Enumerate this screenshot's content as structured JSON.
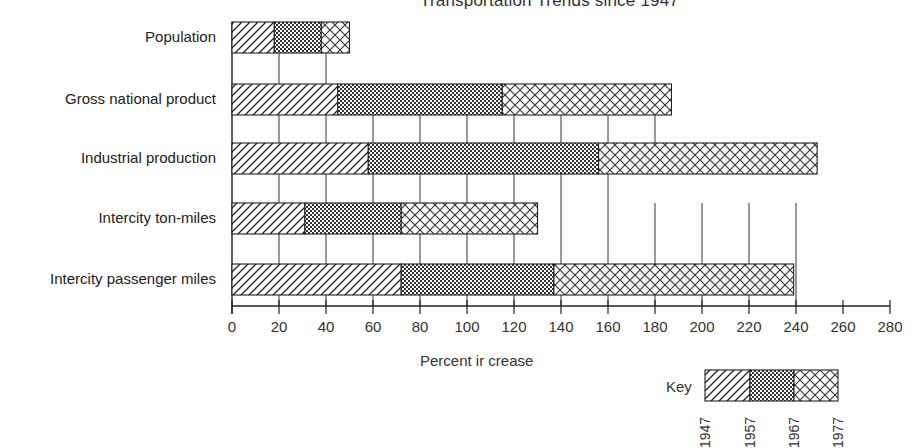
{
  "chart_data": {
    "type": "bar",
    "orientation": "horizontal",
    "stacked": true,
    "title": "Transportation Trends since 1947",
    "title_visible_fragment": "ansportation Trends since 1947",
    "xlabel": "Percent increase",
    "ylabel": "",
    "xlim": [
      0,
      280
    ],
    "xticks": [
      0,
      20,
      40,
      60,
      80,
      100,
      120,
      140,
      160,
      180,
      200,
      220,
      240,
      260,
      280
    ],
    "grid": "vertical gridlines between bars",
    "categories": [
      "Population",
      "Gross national product",
      "Industrial production",
      "Intercity ton-miles",
      "Intercity passenger miles"
    ],
    "cumulative_ends": [
      {
        "category": "Population",
        "1957": 18,
        "1967": 38,
        "1977": 50
      },
      {
        "category": "Gross national product",
        "1957": 45,
        "1967": 115,
        "1977": 187
      },
      {
        "category": "Industrial production",
        "1957": 58,
        "1967": 156,
        "1977": 249
      },
      {
        "category": "Intercity ton-miles",
        "1957": 31,
        "1967": 72,
        "1977": 130
      },
      {
        "category": "Intercity passenger miles",
        "1957": 72,
        "1967": 137,
        "1977": 239
      }
    ],
    "series": [
      {
        "name": "1947–1957",
        "pattern": "diagonal-hatch",
        "values": [
          18,
          45,
          58,
          31,
          72
        ]
      },
      {
        "name": "1957–1967",
        "pattern": "dotted",
        "values": [
          20,
          70,
          98,
          41,
          65
        ]
      },
      {
        "name": "1967–1977",
        "pattern": "crosshatch",
        "values": [
          12,
          72,
          93,
          58,
          102
        ]
      }
    ],
    "legend": {
      "title": "Key",
      "position": "bottom-right",
      "years": [
        "1947",
        "1957",
        "1967",
        "1977"
      ]
    }
  },
  "labels": {
    "title": "Transportation Trends since 1947",
    "xlabel": "Percent ir crease",
    "key": "Key",
    "categories": [
      "Population",
      "Gross national product",
      "Industrial production",
      "Intercity ton-miles",
      "Intercity passenger miles"
    ],
    "ticks": [
      "0",
      "20",
      "40",
      "60",
      "80",
      "100",
      "120",
      "140",
      "160",
      "180",
      "200",
      "220",
      "240",
      "260",
      "280"
    ],
    "key_years": [
      "1947",
      "1957",
      "1967",
      "1977"
    ]
  },
  "colors": {
    "ink": "#222222",
    "background": "#ffffff"
  }
}
